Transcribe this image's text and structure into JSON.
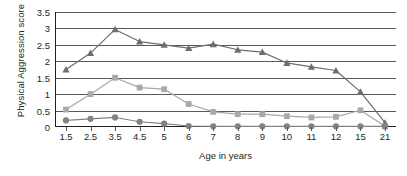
{
  "chart_data": {
    "type": "line",
    "title": "",
    "xlabel": "Age in years",
    "ylabel": "Physical Aggression score",
    "categories": [
      "1.5",
      "2.5",
      "3.5",
      "4.5",
      "5",
      "6",
      "7",
      "8",
      "9",
      "10",
      "11",
      "12",
      "15",
      "21"
    ],
    "ylim": [
      0,
      3.5
    ],
    "yticks": [
      "0",
      "0.5",
      "1",
      "1.5",
      "2",
      "2.5",
      "3",
      "3.5"
    ],
    "ytick_values": [
      0,
      0.5,
      1,
      1.5,
      2,
      2.5,
      3,
      3.5
    ],
    "grid": true,
    "legend_position": "none",
    "series": [
      {
        "name": "high trajectory",
        "marker": "triangle",
        "color": "#6d6e71",
        "values": [
          1.75,
          2.25,
          2.97,
          2.6,
          2.5,
          2.4,
          2.52,
          2.35,
          2.28,
          1.95,
          1.83,
          1.72,
          1.07,
          0.13
        ]
      },
      {
        "name": "moderate trajectory",
        "marker": "square",
        "color": "#a7a9ac",
        "values": [
          0.53,
          1.0,
          1.5,
          1.2,
          1.15,
          0.7,
          0.46,
          0.39,
          0.39,
          0.33,
          0.29,
          0.31,
          0.51,
          0.02
        ]
      },
      {
        "name": "low trajectory",
        "marker": "circle",
        "color": "#808285",
        "values": [
          0.2,
          0.25,
          0.29,
          0.16,
          0.1,
          0.03,
          0.02,
          0.02,
          0.02,
          0.02,
          0.02,
          0.02,
          0.02,
          0.02
        ]
      }
    ]
  },
  "axes": {
    "y_title": "Physical Aggression score",
    "x_title": "Age in years"
  },
  "colors": {
    "axis": "#231f20",
    "grid": "#58595b",
    "background": "#ffffff",
    "series_triangle": "#6d6e71",
    "series_square": "#a7a9ac",
    "series_circle": "#808285"
  }
}
